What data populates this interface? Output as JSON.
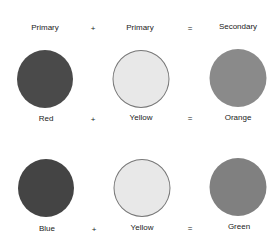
{
  "header": {
    "col1": "Primary",
    "op1": "+",
    "col2": "Primary",
    "op2": "=",
    "col3": "Secondary"
  },
  "rows": [
    {
      "color1": {
        "label": "Red",
        "fill": "#4a4a4a"
      },
      "op1": "+",
      "color2": {
        "label": "Yellow",
        "fill": "#e8e8e8"
      },
      "op2": "=",
      "result": {
        "label": "Orange",
        "fill": "#8a8a8a"
      }
    },
    {
      "color1": {
        "label": "Blue",
        "fill": "#444444"
      },
      "op1": "+",
      "color2": {
        "label": "Yellow",
        "fill": "#e8e8e8"
      },
      "op2": "=",
      "result": {
        "label": "Green",
        "fill": "#808080"
      }
    }
  ]
}
